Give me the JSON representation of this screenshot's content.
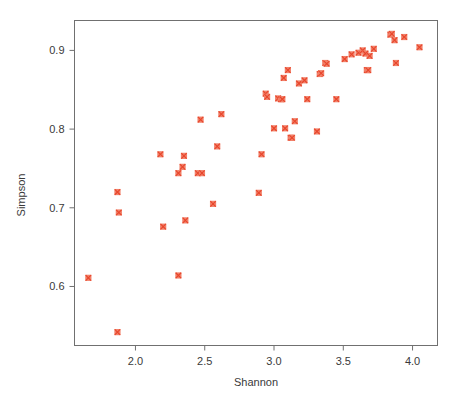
{
  "chart_data": {
    "type": "scatter",
    "title": "",
    "xlabel": "Shannon",
    "ylabel": "Simpson",
    "xlim": [
      1.56,
      4.18
    ],
    "ylim": [
      0.525,
      0.938
    ],
    "xticks": [
      "2.0",
      "2.5",
      "3.0",
      "3.5",
      "4.0"
    ],
    "xtick_values": [
      2.0,
      2.5,
      3.0,
      3.5,
      4.0
    ],
    "yticks": [
      "0.6",
      "0.7",
      "0.8",
      "0.9"
    ],
    "ytick_values": [
      0.6,
      0.7,
      0.8,
      0.9
    ],
    "grid": false,
    "legend": "none",
    "marker": "square-with-x",
    "marker_color": "#e8452a",
    "marker_fill": "#f1816a",
    "n_points": 55,
    "points": [
      [
        1.66,
        0.611
      ],
      [
        1.87,
        0.542
      ],
      [
        1.87,
        0.72
      ],
      [
        1.88,
        0.694
      ],
      [
        2.18,
        0.768
      ],
      [
        2.2,
        0.676
      ],
      [
        2.31,
        0.614
      ],
      [
        2.31,
        0.744
      ],
      [
        2.34,
        0.752
      ],
      [
        2.35,
        0.766
      ],
      [
        2.36,
        0.684
      ],
      [
        2.45,
        0.744
      ],
      [
        2.47,
        0.812
      ],
      [
        2.48,
        0.744
      ],
      [
        2.56,
        0.705
      ],
      [
        2.59,
        0.778
      ],
      [
        2.62,
        0.819
      ],
      [
        2.89,
        0.719
      ],
      [
        2.91,
        0.768
      ],
      [
        2.94,
        0.845
      ],
      [
        2.95,
        0.841
      ],
      [
        3.0,
        0.801
      ],
      [
        3.03,
        0.839
      ],
      [
        3.05,
        0.838
      ],
      [
        3.06,
        0.838
      ],
      [
        3.07,
        0.865
      ],
      [
        3.08,
        0.801
      ],
      [
        3.1,
        0.875
      ],
      [
        3.12,
        0.789
      ],
      [
        3.13,
        0.789
      ],
      [
        3.15,
        0.81
      ],
      [
        3.18,
        0.858
      ],
      [
        3.22,
        0.862
      ],
      [
        3.24,
        0.838
      ],
      [
        3.31,
        0.797
      ],
      [
        3.33,
        0.87
      ],
      [
        3.34,
        0.871
      ],
      [
        3.37,
        0.884
      ],
      [
        3.38,
        0.883
      ],
      [
        3.45,
        0.838
      ],
      [
        3.51,
        0.889
      ],
      [
        3.56,
        0.895
      ],
      [
        3.61,
        0.897
      ],
      [
        3.64,
        0.9
      ],
      [
        3.66,
        0.896
      ],
      [
        3.67,
        0.875
      ],
      [
        3.68,
        0.875
      ],
      [
        3.69,
        0.893
      ],
      [
        3.72,
        0.902
      ],
      [
        3.84,
        0.92
      ],
      [
        3.85,
        0.921
      ],
      [
        3.87,
        0.913
      ],
      [
        3.88,
        0.884
      ],
      [
        3.94,
        0.917
      ],
      [
        4.05,
        0.904
      ]
    ]
  },
  "axes": {
    "y_label": "Simpson",
    "x_label": "Shannon"
  }
}
